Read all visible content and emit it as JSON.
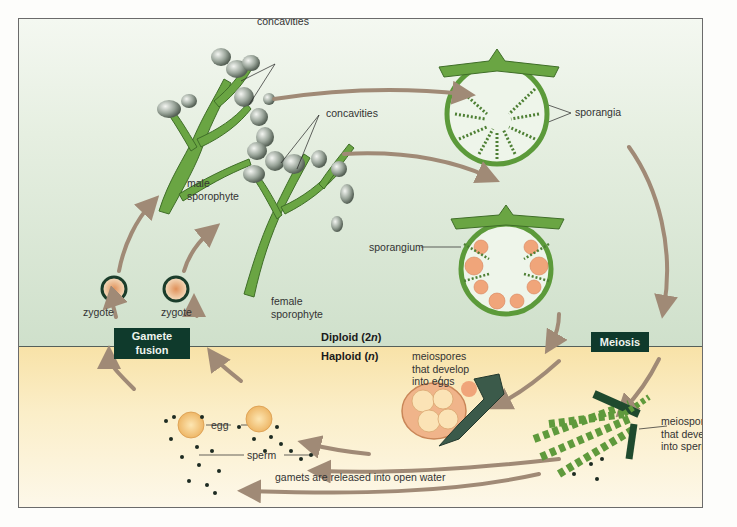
{
  "figure": {
    "zones": {
      "diploid_label": "Diploid (2n)",
      "diploid_prefix": "Diploid (2",
      "diploid_italic": "n",
      "diploid_suffix": ")",
      "haploid_prefix": "Haploid (",
      "haploid_italic": "n",
      "haploid_suffix": ")"
    },
    "process_boxes": {
      "gamete_fusion_line1": "Gamete",
      "gamete_fusion_line2": "fusion",
      "meiosis": "Meiosis"
    },
    "labels": {
      "concavities_male": "concavities",
      "concavities_female": "concavities",
      "male_sporophyte_line1": "male",
      "male_sporophyte_line2": "sporophyte",
      "female_sporophyte_line1": "female",
      "female_sporophyte_line2": "sporophyte",
      "sporangia": "sporangia",
      "sporangium": "sporangium",
      "zygote_left": "zygote",
      "zygote_right": "zygote",
      "meiospores_eggs_line1": "meiospores",
      "meiospores_eggs_line2": "that develop",
      "meiospores_eggs_line3": "into eggs",
      "meiospores_sperm_line1": "meiospores",
      "meiospores_sperm_line2": "that develop",
      "meiospores_sperm_line3": "into sperm",
      "egg": "egg",
      "sperm": "sperm",
      "gametes_released": "gamets are released into open water"
    },
    "colors": {
      "diploid_bg": "#dfeadb",
      "haploid_bg": "#fbecc2",
      "arrow": "#a08a76",
      "box_fill": "#0f3a2c",
      "alga_green": "#5f9a3c",
      "sporangium_orange": "#f0a57a",
      "egg_yellow": "#f2c678"
    }
  }
}
